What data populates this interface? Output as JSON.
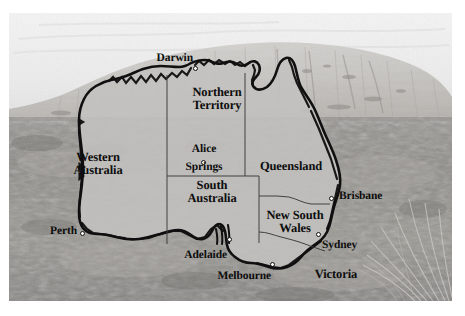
{
  "image": {
    "kind": "photo-map-composite",
    "subject": "Map of Australia overlaid on a photograph of Uluru and the outback",
    "palette": {
      "paper": "#ffffff",
      "sky": "#e9e9e9",
      "rock": "#c9c7c4",
      "ground": "#8e8c88",
      "map_fill": "#c0bfbd",
      "outline": "#111111",
      "label": "#0d0d0d",
      "city_marker": "#fdfdfd"
    }
  },
  "map": {
    "title": "Australia",
    "states": [
      {
        "id": "wa",
        "label_line1": "Western",
        "label_line2": "Australia",
        "x": 88,
        "y": 145
      },
      {
        "id": "nt",
        "label_line1": "Northern",
        "label_line2": "Territory",
        "x": 181,
        "y": 80
      },
      {
        "id": "sa",
        "label_line1": "South",
        "label_line2": "Australia",
        "x": 180,
        "y": 160
      },
      {
        "id": "qld",
        "label_line1": "Queensland",
        "label_line2": "",
        "x": 240,
        "y": 142
      },
      {
        "id": "nsw",
        "label_line1": "New South",
        "label_line2": "Wales",
        "x": 252,
        "y": 192
      },
      {
        "id": "vic",
        "label_line1": "Victoria",
        "label_line2": "",
        "x": 300,
        "y": 258
      }
    ],
    "cities": [
      {
        "id": "darwin",
        "label_line1": "Darwin",
        "label_line2": "",
        "dot_x": 186,
        "dot_y": 55,
        "label_x": 151,
        "label_y": 42,
        "align": "right"
      },
      {
        "id": "alice-springs",
        "label_line1": "Alice",
        "label_line2": "Springs",
        "dot_x": 196,
        "dot_y": 150,
        "label_x": 196,
        "label_y": 134,
        "align": "center"
      },
      {
        "id": "brisbane",
        "label_line1": "Brisbane",
        "label_line2": "",
        "dot_x": 322,
        "dot_y": 185,
        "label_x": 331,
        "label_y": 179,
        "align": "left"
      },
      {
        "id": "perth",
        "label_line1": "Perth",
        "label_line2": "",
        "dot_x": 93,
        "dot_y": 220,
        "label_x": 86,
        "label_y": 214,
        "align": "right"
      },
      {
        "id": "adelaide",
        "label_line1": "Adelaide",
        "label_line2": "",
        "dot_x": 221,
        "dot_y": 227,
        "label_x": 222,
        "label_y": 236,
        "align": "right"
      },
      {
        "id": "sydney",
        "label_line1": "Sydney",
        "label_line2": "",
        "dot_x": 308,
        "dot_y": 221,
        "label_x": 314,
        "label_y": 227,
        "align": "left"
      },
      {
        "id": "melbourne",
        "label_line1": "Melbourne",
        "label_line2": "",
        "dot_x": 262,
        "dot_y": 251,
        "label_x": 256,
        "label_y": 257,
        "align": "right"
      }
    ]
  }
}
